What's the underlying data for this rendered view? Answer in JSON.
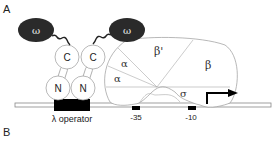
{
  "panels": {
    "a_label": "A",
    "b_label": "B"
  },
  "proteins": {
    "omega_left": "ω",
    "omega_right": "ω",
    "c_left": "C",
    "c_right": "C",
    "n_left": "N",
    "n_right": "N"
  },
  "rnap": {
    "alpha_upper": "α",
    "alpha_lower": "α",
    "beta_prime": "β'",
    "beta": "β",
    "sigma": "σ"
  },
  "dna": {
    "operator_label": "λ operator",
    "minus35_label": "-35",
    "minus10_label": "-10"
  },
  "colors": {
    "omega_fill": "#2a2a2a",
    "outline": "#999999",
    "dna_box": "#000000"
  }
}
